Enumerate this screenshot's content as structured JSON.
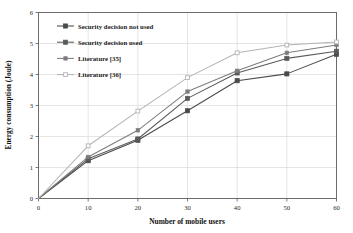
{
  "chart_data": {
    "type": "line",
    "title": "",
    "xlabel": "Number of mobile users",
    "ylabel": "Energy consumption (Joule)",
    "x": [
      0,
      10,
      20,
      30,
      40,
      50,
      60
    ],
    "xlim": [
      0,
      60
    ],
    "ylim": [
      0,
      6
    ],
    "xticks": [
      "0",
      "10",
      "20",
      "30",
      "40",
      "50",
      "60"
    ],
    "yticks": [
      "0",
      "1",
      "2",
      "3",
      "4",
      "5",
      "6"
    ],
    "grid": true,
    "legend_position": "upper-left-inside",
    "series": [
      {
        "name": "Security decision not used",
        "color": "#4a4a4a",
        "marker": "square-filled",
        "values": [
          0,
          1.22,
          1.88,
          2.83,
          3.8,
          4.02,
          4.65
        ]
      },
      {
        "name": "Security decision used",
        "color": "#5a5a5a",
        "marker": "square-filled",
        "values": [
          0,
          1.28,
          1.92,
          3.23,
          4.05,
          4.52,
          4.75
        ]
      },
      {
        "name": "Literature [35]",
        "color": "#7d7d7d",
        "marker": "square-small",
        "values": [
          0,
          1.34,
          2.2,
          3.45,
          4.12,
          4.7,
          4.95
        ]
      },
      {
        "name": "Literature [36]",
        "color": "#b4b4b4",
        "marker": "square-open",
        "values": [
          0,
          1.7,
          2.82,
          3.9,
          4.7,
          4.95,
          5.05
        ]
      }
    ]
  },
  "legend": {
    "entries": [
      "Security decision not used",
      "Security decision used",
      "Literature [35]",
      "Literature [36]"
    ]
  }
}
